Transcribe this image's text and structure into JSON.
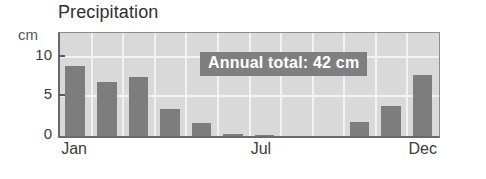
{
  "chart_data": {
    "type": "bar",
    "title": "Precipitation",
    "xlabel": "",
    "ylabel": "cm",
    "ylim": [
      0,
      13
    ],
    "yticks": [
      0,
      5,
      10
    ],
    "ytick_labels": [
      "0",
      "5",
      "10"
    ],
    "grid": true,
    "legend": null,
    "categories": [
      "Jan",
      "Feb",
      "Mar",
      "Apr",
      "May",
      "Jun",
      "Jul",
      "Aug",
      "Sep",
      "Oct",
      "Nov",
      "Dec"
    ],
    "xtick_labels": [
      "Jan",
      "Jul",
      "Dec"
    ],
    "values": [
      8.8,
      6.8,
      7.4,
      3.4,
      1.7,
      0.3,
      0.1,
      0.0,
      0.0,
      1.8,
      3.8,
      7.7
    ],
    "annotations": [
      {
        "text": "Annual total: 42 cm"
      }
    ],
    "colors": {
      "bar": "#7d7d7d",
      "plot_background": "#d9d9d9",
      "gridline": "#f2f2f2",
      "axis": "#6a6a6a",
      "annotation_background": "#7f7f7f",
      "annotation_text": "#ffffff",
      "title_text": "#2f2f2f",
      "tick_text": "#3a3a3a",
      "page_background": "#ffffff"
    }
  }
}
